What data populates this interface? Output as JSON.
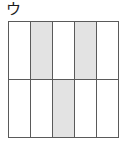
{
  "figure": {
    "label": "ウ",
    "type": "fraction-grid-diagram",
    "grid": {
      "columns": 5,
      "rows": 2,
      "outline_color": "#5a5a5a",
      "cell_fill_color": "#ffffff",
      "shaded_fill_color": "#e3e3e3",
      "background_color": "#ffffff",
      "rows_data": [
        {
          "row_index": 0,
          "cells": [
            {
              "column_index": 0,
              "shaded": false,
              "state": "unshaded"
            },
            {
              "column_index": 1,
              "shaded": true,
              "state": "shaded"
            },
            {
              "column_index": 2,
              "shaded": false,
              "state": "unshaded"
            },
            {
              "column_index": 3,
              "shaded": true,
              "state": "shaded"
            },
            {
              "column_index": 4,
              "shaded": false,
              "state": "unshaded"
            }
          ]
        },
        {
          "row_index": 1,
          "cells": [
            {
              "column_index": 0,
              "shaded": false,
              "state": "unshaded"
            },
            {
              "column_index": 1,
              "shaded": false,
              "state": "unshaded"
            },
            {
              "column_index": 2,
              "shaded": true,
              "state": "shaded"
            },
            {
              "column_index": 3,
              "shaded": false,
              "state": "unshaded"
            },
            {
              "column_index": 4,
              "shaded": false,
              "state": "unshaded"
            }
          ]
        }
      ]
    }
  }
}
